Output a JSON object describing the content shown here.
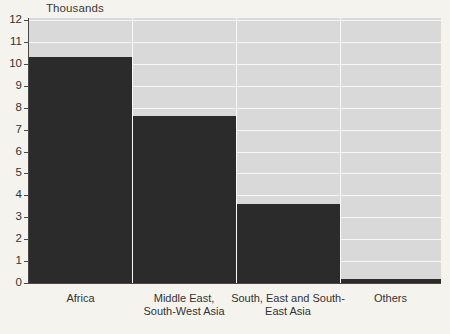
{
  "chart_data": {
    "type": "bar",
    "title": "",
    "subtitle": "",
    "xlabel": "",
    "ylabel": "Thousands",
    "unit_caption": "Thousands",
    "categories": [
      "Africa",
      "Middle East,\nSouth-West Asia",
      "South, East and South-\nEast Asia",
      "Others"
    ],
    "values": [
      10.3,
      7.6,
      3.6,
      0.2
    ],
    "ylim": [
      0,
      12
    ],
    "ytick_labels": [
      "0",
      "1",
      "2",
      "3",
      "4",
      "5",
      "6",
      "7",
      "8",
      "9",
      "10",
      "11",
      "12"
    ],
    "ytick_values": [
      0,
      1,
      2,
      3,
      4,
      5,
      6,
      7,
      8,
      9,
      10,
      11,
      12
    ],
    "grid": true,
    "legend": "none",
    "bar_widths_relative": [
      103,
      104,
      104,
      101
    ],
    "colors": {
      "bar": "#2b2b2b",
      "plot_background": "#d9d9d9",
      "page_background": "#f5f3ed",
      "gridline": "#f7f7f7",
      "axis": "#4a4a4a",
      "text": "#333333"
    }
  }
}
